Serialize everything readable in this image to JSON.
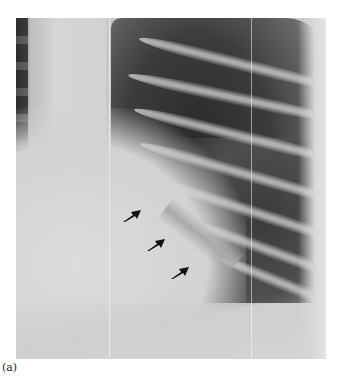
{
  "figure": {
    "type": "chest radiograph",
    "caption": "(a)",
    "annotations": [
      {
        "kind": "arrow",
        "x": 133,
        "y": 214
      },
      {
        "kind": "arrow",
        "x": 157,
        "y": 243
      },
      {
        "kind": "arrow",
        "x": 181,
        "y": 271
      }
    ]
  }
}
